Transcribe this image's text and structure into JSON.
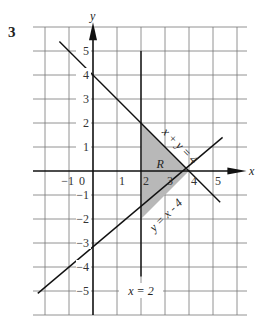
{
  "problem_number": "3",
  "axes": {
    "x_label": "x",
    "y_label": "y",
    "origin_label": "0"
  },
  "x_ticks": [
    {
      "value": -1,
      "label": "-1"
    },
    {
      "value": 1,
      "label": "1"
    },
    {
      "value": 2,
      "label": "2"
    },
    {
      "value": 3,
      "label": "3"
    },
    {
      "value": 4,
      "label": "4"
    },
    {
      "value": 5,
      "label": "5"
    }
  ],
  "y_ticks": [
    {
      "value": 5,
      "label": "5"
    },
    {
      "value": 4,
      "label": "4"
    },
    {
      "value": 3,
      "label": "3"
    },
    {
      "value": 2,
      "label": "2"
    },
    {
      "value": 1,
      "label": "1"
    },
    {
      "value": -1,
      "label": "-1"
    },
    {
      "value": -2,
      "label": "-2"
    },
    {
      "value": -3,
      "label": "-3"
    },
    {
      "value": -4,
      "label": "-4"
    },
    {
      "value": -5,
      "label": "-5"
    }
  ],
  "lines": {
    "line1": {
      "equation": "x + y = 4"
    },
    "line2": {
      "equation": "y = x - 4"
    },
    "line3": {
      "equation": "x = 2"
    }
  },
  "region": {
    "label": "R",
    "vertices": [
      [
        2,
        2
      ],
      [
        4,
        0
      ],
      [
        2,
        -2
      ]
    ],
    "fill": "#b8b8b8"
  },
  "colors": {
    "grid": "#777777",
    "lines": "#111111",
    "shade": "#b8b8b8"
  }
}
